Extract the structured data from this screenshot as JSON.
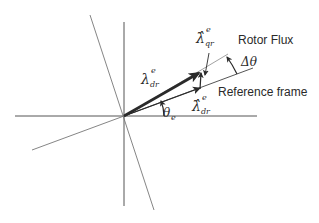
{
  "diagram": {
    "title": "",
    "colors": {
      "axis": "#555555",
      "vector": "#2a2a2a",
      "thin_line": "#7a7a7a",
      "background": "#ffffff"
    },
    "labels": {
      "rotor_flux": "Rotor Flux",
      "reference_frame": "Reference frame",
      "delta_theta": "Δθ",
      "theta_e_sym": "θ",
      "theta_e_sub": "e",
      "lambda_dr_sym": "λ",
      "lambda_dr_sup": "e",
      "lambda_dr_sub": "dr",
      "lambda_hat_qr_sym": "λ̂",
      "lambda_hat_qr_sup": "e",
      "lambda_hat_qr_sub": "qr",
      "lambda_hat_dr_sym": "λ̂",
      "lambda_hat_dr_sup": "e",
      "lambda_hat_dr_sub": "dr"
    }
  }
}
